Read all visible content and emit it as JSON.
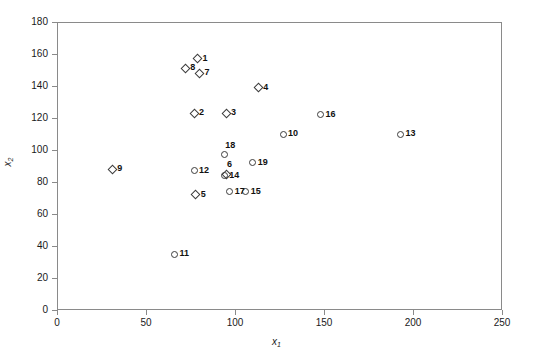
{
  "chart_data": {
    "type": "scatter",
    "title": "",
    "xlabel": "x1",
    "ylabel": "x2",
    "xlim": [
      0,
      250
    ],
    "ylim": [
      0,
      180
    ],
    "xticks": [
      0,
      50,
      100,
      150,
      200,
      250
    ],
    "yticks": [
      0,
      20,
      40,
      60,
      80,
      100,
      120,
      140,
      160,
      180
    ],
    "grid": false,
    "legend": "none",
    "marker_colors": {
      "stroke": "#3c3c3c",
      "axis": "#8a8a8a",
      "text": "#111111",
      "background": "#ffffff"
    },
    "points": [
      {
        "label": "1",
        "x": 79,
        "y": 157,
        "marker": "diamond",
        "label_pos": "right"
      },
      {
        "label": "2",
        "x": 77,
        "y": 123,
        "marker": "diamond",
        "label_pos": "right"
      },
      {
        "label": "3",
        "x": 95,
        "y": 123,
        "marker": "diamond",
        "label_pos": "right"
      },
      {
        "label": "4",
        "x": 113,
        "y": 139,
        "marker": "diamond",
        "label_pos": "right"
      },
      {
        "label": "5",
        "x": 78,
        "y": 72,
        "marker": "diamond",
        "label_pos": "right"
      },
      {
        "label": "6",
        "x": 95,
        "y": 85,
        "marker": "diamond",
        "label_pos": "above-right"
      },
      {
        "label": "7",
        "x": 80,
        "y": 148,
        "marker": "diamond",
        "label_pos": "right"
      },
      {
        "label": "8",
        "x": 72,
        "y": 151,
        "marker": "diamond",
        "label_pos": "right"
      },
      {
        "label": "9",
        "x": 31,
        "y": 88,
        "marker": "diamond",
        "label_pos": "right"
      },
      {
        "label": "10",
        "x": 127,
        "y": 110,
        "marker": "circle",
        "label_pos": "right"
      },
      {
        "label": "11",
        "x": 66,
        "y": 35,
        "marker": "circle",
        "label_pos": "right"
      },
      {
        "label": "12",
        "x": 77,
        "y": 87,
        "marker": "circle",
        "label_pos": "right"
      },
      {
        "label": "13",
        "x": 193,
        "y": 110,
        "marker": "circle",
        "label_pos": "right"
      },
      {
        "label": "14",
        "x": 94,
        "y": 84,
        "marker": "circle",
        "label_pos": "right"
      },
      {
        "label": "15",
        "x": 106,
        "y": 74,
        "marker": "circle",
        "label_pos": "right"
      },
      {
        "label": "16",
        "x": 148,
        "y": 122,
        "marker": "circle",
        "label_pos": "right"
      },
      {
        "label": "17",
        "x": 97,
        "y": 74,
        "marker": "circle",
        "label_pos": "right"
      },
      {
        "label": "18",
        "x": 94,
        "y": 97,
        "marker": "circle",
        "label_pos": "above-right"
      },
      {
        "label": "19",
        "x": 110,
        "y": 92,
        "marker": "circle",
        "label_pos": "right"
      }
    ]
  }
}
